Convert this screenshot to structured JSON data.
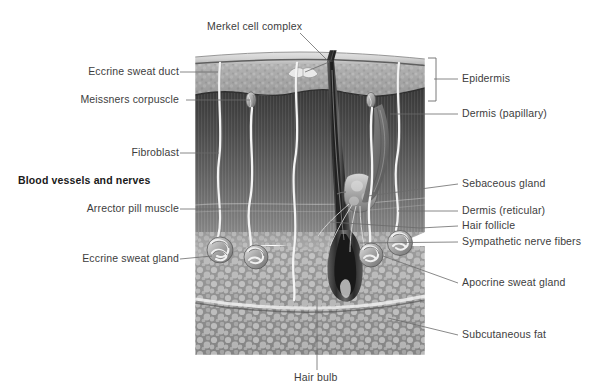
{
  "figure": {
    "labels_left": [
      {
        "id": "eccrine-sweat-duct",
        "text": "Eccrine sweat duct",
        "x": 86,
        "y": 72,
        "anchor_x": 197,
        "anchor_y": 72
      },
      {
        "id": "meissners-corpuscle",
        "text": "Meissners corpuscle",
        "x": 80,
        "y": 100,
        "anchor_x": 250,
        "anchor_y": 100
      },
      {
        "id": "fibroblast",
        "text": "Fibroblast",
        "x": 128,
        "y": 153,
        "anchor_x": 215,
        "anchor_y": 153
      },
      {
        "id": "blood-vessels-and-nerves",
        "text": "Blood vessels and nerves",
        "x": 18,
        "y": 181,
        "anchor_x": null,
        "anchor_y": null,
        "bold": true
      },
      {
        "id": "arrector-pill-muscle",
        "text": "Arrector pill muscle",
        "x": 87,
        "y": 209,
        "anchor_x": 224,
        "anchor_y": 209
      },
      {
        "id": "eccrine-sweat-gland",
        "text": "Eccrine sweat gland",
        "x": 77,
        "y": 259,
        "anchor_x": 217,
        "anchor_y": 256
      }
    ],
    "labels_right": [
      {
        "id": "epidermis",
        "text": "Epidermis",
        "x": 462,
        "y": 79
      },
      {
        "id": "dermis-papillary",
        "text": "Dermis (papillary)",
        "x": 462,
        "y": 114,
        "anchor_x": 385,
        "anchor_y": 114
      },
      {
        "id": "sebaceous-gland",
        "text": "Sebaceous gland",
        "x": 462,
        "y": 184,
        "anchor_x": 352,
        "anchor_y": 196
      },
      {
        "id": "dermis-reticular",
        "text": "Dermis (reticular)",
        "x": 462,
        "y": 211,
        "anchor_x": 392,
        "anchor_y": 211
      },
      {
        "id": "hair-follicle",
        "text": "Hair follicle",
        "x": 462,
        "y": 226,
        "anchor_x": 318,
        "anchor_y": 222
      },
      {
        "id": "sympathetic-nerve-fibers",
        "text": "Sympathetic nerve fibers",
        "x": 462,
        "y": 242,
        "anchor_x": 355,
        "anchor_y": 243
      },
      {
        "id": "apocrine-sweat-gland",
        "text": "Apocrine sweat gland",
        "x": 462,
        "y": 283,
        "anchor_x": 381,
        "anchor_y": 256
      },
      {
        "id": "subcutaneous-fat",
        "text": "Subcutaneous fat",
        "x": 462,
        "y": 335,
        "anchor_x": 383,
        "anchor_y": 320
      }
    ],
    "labels_top": [
      {
        "id": "merkel-cell-complex",
        "text": "Merkel cell complex",
        "x": 207,
        "y": 27,
        "anchor_x": 303,
        "anchor_y": 72
      }
    ],
    "labels_bottom": [
      {
        "id": "hair-bulb",
        "text": "Hair bulb",
        "x": 294,
        "y": 378,
        "anchor_x": 317,
        "anchor_y": 300
      }
    ],
    "bracket": {
      "id": "epidermis-bracket",
      "x": 434,
      "y_top": 58,
      "y_bottom": 101,
      "tick_x": 455,
      "tick_y": 79
    },
    "image_bounds": {
      "x": 195,
      "y": 50,
      "width": 230,
      "height": 305
    },
    "layers": [
      {
        "name": "stratum corneum",
        "color": "#cfcfcf"
      },
      {
        "name": "epidermis",
        "color": "#a8a8a8"
      },
      {
        "name": "papillary dermis",
        "color": "#5a5a5a"
      },
      {
        "name": "reticular dermis",
        "color": "#8e8e8e"
      },
      {
        "name": "subcutaneous fat",
        "color": "#9a9a9a"
      }
    ],
    "colors": {
      "label_text": "#3d3d3d",
      "bold_text": "#1a1a1a",
      "leader_line": "#6b6b6b",
      "background": "#ffffff",
      "duct_white": "#f2f2f2",
      "hair_dark": "#262626"
    }
  }
}
